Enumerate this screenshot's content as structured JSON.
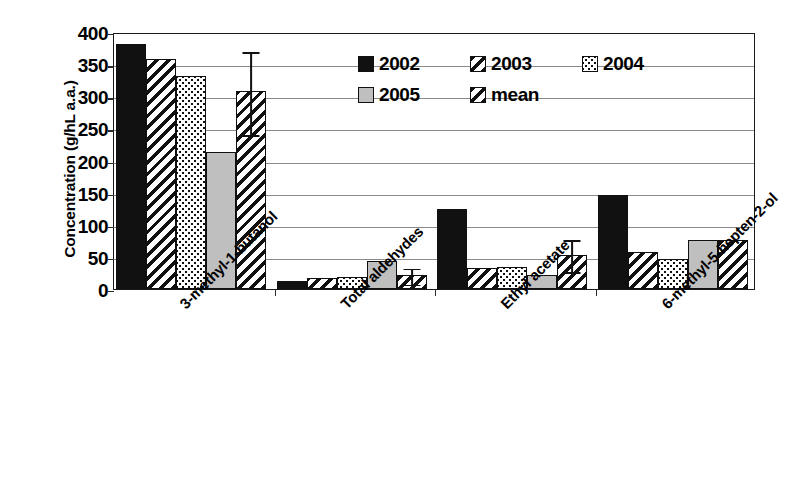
{
  "chart_data": {
    "type": "bar",
    "title": "",
    "xlabel": "",
    "ylabel": "Concentration (g/hL a.a.)",
    "ylim": [
      0,
      400
    ],
    "ytick_step": 50,
    "yticks": [
      "400",
      "350",
      "300",
      "250",
      "200",
      "150",
      "100",
      "50",
      "0"
    ],
    "grid": true,
    "legend_position": "upper-center",
    "categories": [
      "3-methyl-1-butanol",
      "Total aldehydes",
      "Ethyl acetate",
      "6-methyl-5-hepten-2-ol"
    ],
    "series": [
      {
        "name": "2002",
        "pattern": "solid-black",
        "values": [
          382,
          12,
          125,
          147
        ]
      },
      {
        "name": "2003",
        "pattern": "diagonal-stripes",
        "values": [
          358,
          17,
          33,
          57
        ]
      },
      {
        "name": "2004",
        "pattern": "dotted",
        "values": [
          331,
          18,
          35,
          47
        ]
      },
      {
        "name": "2005",
        "pattern": "light-gray",
        "values": [
          213,
          43,
          22,
          77
        ]
      },
      {
        "name": "mean",
        "pattern": "diagonal-stripes",
        "values": [
          308,
          22,
          53,
          77
        ]
      }
    ],
    "error_bars": {
      "series": "mean",
      "lower": [
        243,
        10,
        30,
        77
      ],
      "upper": [
        372,
        35,
        79,
        77
      ],
      "values": [
        308,
        22,
        53,
        77
      ]
    }
  },
  "legend": {
    "entries": [
      {
        "label": "2002",
        "pattern": "solid-black"
      },
      {
        "label": "2003",
        "pattern": "diagonal-stripes"
      },
      {
        "label": "2004",
        "pattern": "dotted"
      },
      {
        "label": "2005",
        "pattern": "light-gray"
      },
      {
        "label": "mean",
        "pattern": "diagonal-stripes"
      }
    ]
  },
  "colors": {
    "axis": "#1a1a1a",
    "grid": "#8a8a8a",
    "bar_solid": "#111111",
    "bar_gray": "#bfbfbf",
    "background": "#ffffff"
  }
}
